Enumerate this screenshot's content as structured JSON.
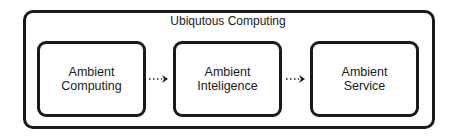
{
  "diagram": {
    "container": {
      "label": "Ubiqutous Computing"
    },
    "nodes": [
      {
        "id": "ambient-computing",
        "line1": "Ambient",
        "line2": "Computing"
      },
      {
        "id": "ambient-inteligence",
        "line1": "Ambient",
        "line2": "Inteligence"
      },
      {
        "id": "ambient-service",
        "line1": "Ambient",
        "line2": "Service"
      }
    ],
    "edges": [
      {
        "from": "ambient-computing",
        "to": "ambient-inteligence",
        "style": "dotted-arrow"
      },
      {
        "from": "ambient-inteligence",
        "to": "ambient-service",
        "style": "dotted-arrow"
      }
    ],
    "colors": {
      "stroke": "#1a1a1a",
      "background": "#ffffff"
    }
  }
}
